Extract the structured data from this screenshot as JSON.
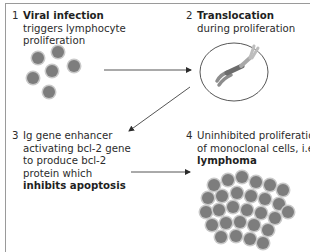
{
  "steps": [
    {
      "number": "1",
      "title": "Viral infection",
      "lines": [
        "triggers lymphocyte",
        "proliferation"
      ]
    },
    {
      "number": "2",
      "title": "Translocation",
      "lines": [
        "during proliferation"
      ]
    },
    {
      "number": "3",
      "lines": [
        "Ig gene enhancer",
        "activating bcl-2 gene",
        "to produce bcl-2",
        "protein which"
      ],
      "bold_line": "inhibits apoptosis"
    },
    {
      "number": "4",
      "lines": [
        "Uninhibited proliferation",
        "of monoclonal cells, i.e."
      ],
      "bold_line": "lymphoma"
    }
  ],
  "illustrations": {
    "step1": "scattered-lymphocytes",
    "step2": "cell-with-translocated-chromosomes",
    "step4": "monoclonal-cell-cluster"
  },
  "colors": {
    "frame": "#9a9a9a",
    "text": "#2b2b2b",
    "cell_nucleus": "#7a7a7a",
    "cell_rim": "#c4c4c4",
    "arrow": "#555555"
  }
}
